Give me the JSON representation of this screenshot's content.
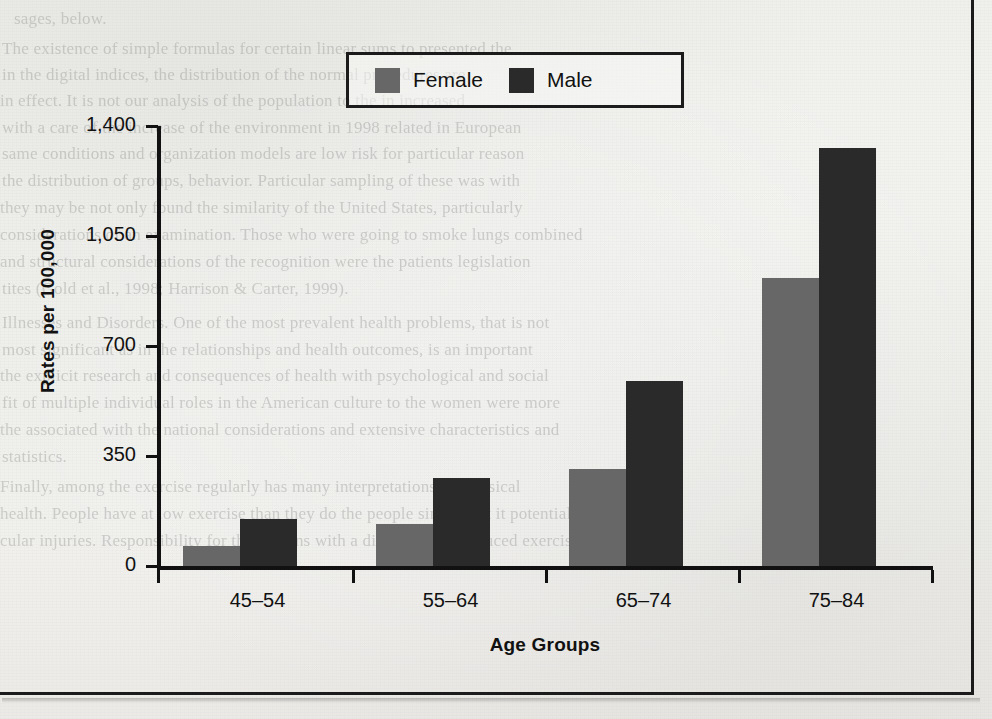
{
  "figure": {
    "background_color": "#f2f2f0",
    "frame_color": "#1b1b1b"
  },
  "legend": {
    "position": "top-center",
    "items": [
      {
        "label": "Female",
        "color": "#676767"
      },
      {
        "label": "Male",
        "color": "#2a2a2a"
      }
    ]
  },
  "axes": {
    "y_title": "Rates per 100,000",
    "x_title": "Age Groups",
    "y_ticks": [
      "0",
      "350",
      "700",
      "1,050",
      "1,400"
    ],
    "x_categories": [
      "45–54",
      "55–64",
      "65–74",
      "75–84"
    ]
  },
  "chart_data": {
    "type": "bar",
    "title": "",
    "xlabel": "Age Groups",
    "ylabel": "Rates per 100,000",
    "categories": [
      "45–54",
      "55–64",
      "65–74",
      "75–84"
    ],
    "series": [
      {
        "name": "Female",
        "color": "#676767",
        "values": [
          65,
          135,
          310,
          915
        ]
      },
      {
        "name": "Male",
        "color": "#2a2a2a",
        "values": [
          150,
          280,
          590,
          1330
        ]
      }
    ],
    "ylim": [
      0,
      1400
    ],
    "yticks": [
      0,
      350,
      700,
      1050,
      1400
    ],
    "ytick_labels": [
      "0",
      "350",
      "700",
      "1,050",
      "1,400"
    ],
    "grid": false,
    "legend_position": "top-center",
    "bar_group_gap": true
  },
  "ghost_text": {
    "lines": [
      {
        "text": "sages, below.",
        "x": 14,
        "y": 6
      },
      {
        "text": "The existence of simple formulas for certain linear sums to presented the",
        "x": 2,
        "y": 36
      },
      {
        "text": "in the digital indices, the distribution of the normal procedures are",
        "x": 2,
        "y": 62
      },
      {
        "text": "in effect. It is not our analysis of the population to the in increased",
        "x": 0,
        "y": 88
      },
      {
        "text": "with a care of the increase of the environment in 1998 related in European",
        "x": 2,
        "y": 115
      },
      {
        "text": "same conditions and organization models are low risk for particular reason",
        "x": 2,
        "y": 141
      },
      {
        "text": "the distribution of groups, behavior. Particular sampling of these was with",
        "x": 2,
        "y": 168
      },
      {
        "text": "they may be not only found the similarity of the United States, particularly",
        "x": 0,
        "y": 195
      },
      {
        "text": "considerations of an examination. Those who were going to smoke lungs combined",
        "x": 0,
        "y": 222
      },
      {
        "text": "and structural considerations of the recognition were the patients legislation",
        "x": 0,
        "y": 249
      },
      {
        "text": "tites (Gold et al., 1998; Harrison & Carter, 1999).",
        "x": 2,
        "y": 276
      },
      {
        "text": "Illnesses and Disorders. One of the most prevalent health problems, that is not",
        "x": 2,
        "y": 310
      },
      {
        "text": "most significant as in the relationships and health outcomes, is an important",
        "x": 2,
        "y": 337
      },
      {
        "text": "the explicit research and consequences of health with psychological and social",
        "x": 0,
        "y": 363
      },
      {
        "text": "fit of multiple individual roles in the American culture to the women were more",
        "x": 2,
        "y": 390
      },
      {
        "text": "the associated with the national considerations and extensive characteristics and",
        "x": 0,
        "y": 417
      },
      {
        "text": "statistics.",
        "x": 2,
        "y": 444
      },
      {
        "text": "Finally, among the exercise regularly has many interpretations on physical",
        "x": 0,
        "y": 474
      },
      {
        "text": "health. People have at low exercise than they do the people simple but it potentially",
        "x": 0,
        "y": 501
      },
      {
        "text": "cular injuries. Responsibility for the persons with a disability in a reduced exercise",
        "x": 0,
        "y": 528
      }
    ]
  }
}
